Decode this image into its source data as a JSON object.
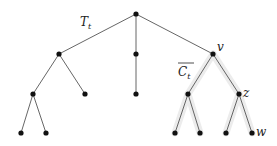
{
  "diagram": {
    "type": "tree",
    "labels": {
      "tree": "T",
      "tree_sub": "t",
      "component": "C",
      "component_sub": "t",
      "v": "v",
      "z": "z",
      "w": "w"
    },
    "nodes": [
      {
        "id": "root",
        "x": 136,
        "y": 14
      },
      {
        "id": "a",
        "x": 59,
        "y": 54
      },
      {
        "id": "b",
        "x": 136,
        "y": 54
      },
      {
        "id": "v",
        "x": 213,
        "y": 54
      },
      {
        "id": "a1",
        "x": 33,
        "y": 94
      },
      {
        "id": "a2",
        "x": 85,
        "y": 94
      },
      {
        "id": "b1",
        "x": 136,
        "y": 94
      },
      {
        "id": "v1",
        "x": 188,
        "y": 94
      },
      {
        "id": "z",
        "x": 239,
        "y": 94
      },
      {
        "id": "a11",
        "x": 21,
        "y": 133
      },
      {
        "id": "a12",
        "x": 46,
        "y": 133
      },
      {
        "id": "v11",
        "x": 175,
        "y": 133
      },
      {
        "id": "v12",
        "x": 200,
        "y": 133
      },
      {
        "id": "z1",
        "x": 226,
        "y": 133
      },
      {
        "id": "w",
        "x": 252,
        "y": 133
      }
    ],
    "edges": [
      [
        "root",
        "a"
      ],
      [
        "root",
        "b"
      ],
      [
        "root",
        "v"
      ],
      [
        "a",
        "a1"
      ],
      [
        "a",
        "a2"
      ],
      [
        "b",
        "b1"
      ],
      [
        "v",
        "v1"
      ],
      [
        "v",
        "z"
      ],
      [
        "a1",
        "a11"
      ],
      [
        "a1",
        "a12"
      ],
      [
        "v1",
        "v11"
      ],
      [
        "v1",
        "v12"
      ],
      [
        "z",
        "z1"
      ],
      [
        "z",
        "w"
      ]
    ],
    "highlighted_subtree_root": "v"
  }
}
